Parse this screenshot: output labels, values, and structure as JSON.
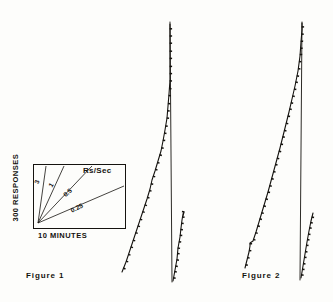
{
  "figure_sheet": {
    "background_color": "#fdfdfb",
    "ink_color": "#15130f"
  },
  "captions": {
    "figure_1": "Figure  1",
    "figure_2": "Figure  2"
  },
  "inset": {
    "name": "rate-calibration-inset",
    "header": "Rs/Sec",
    "y_axis_label": "300 RESPONSES",
    "x_axis_label": "10 MINUTES",
    "box": {
      "x": 33,
      "y": 164,
      "width": 92,
      "height": 64
    },
    "origin": {
      "x": 38,
      "y": 223
    },
    "rate_lines": [
      {
        "label": "3",
        "end_x": 46,
        "end_y": 166,
        "label_x": 36,
        "label_y": 180,
        "label_rotation": -73
      },
      {
        "label": "1",
        "end_x": 64,
        "end_y": 166,
        "label_x": 50,
        "label_y": 183,
        "label_rotation": -58
      },
      {
        "label": "0.5",
        "end_x": 92,
        "end_y": 166,
        "label_x": 64,
        "label_y": 192,
        "label_rotation": -42
      },
      {
        "label": "0.25",
        "end_x": 124,
        "end_y": 186,
        "label_x": 71,
        "label_y": 207,
        "label_rotation": -26
      }
    ]
  },
  "chart_data": {
    "type": "line",
    "xlabel": "10 MINUTES",
    "ylabel": "300 RESPONSES",
    "grid": false,
    "legend": "inset rate calibration (Rs/Sec: 3, 1, 0.5, 0.25)",
    "panels": [
      {
        "name": "Figure 1",
        "caption": "Figure  1",
        "segments": [
          {
            "name": "session-1-cumulative-record",
            "kind": "cumulative",
            "points": [
              [
                122,
                272
              ],
              [
                126,
                262
              ],
              [
                129,
                253
              ],
              [
                132,
                244
              ],
              [
                135,
                235
              ],
              [
                138,
                226
              ],
              [
                141,
                217
              ],
              [
                144,
                208
              ],
              [
                147,
                199
              ],
              [
                150,
                189
              ],
              [
                152,
                180
              ],
              [
                155,
                171
              ],
              [
                158,
                161
              ],
              [
                161,
                151
              ],
              [
                163,
                141
              ],
              [
                165,
                130
              ],
              [
                167,
                118
              ],
              [
                168,
                106
              ],
              [
                169,
                94
              ],
              [
                170,
                80
              ],
              [
                170,
                60
              ],
              [
                170,
                40
              ],
              [
                170,
                24
              ]
            ],
            "pip_count": 34
          },
          {
            "name": "session-1-reset-line",
            "kind": "reset",
            "points": [
              [
                170,
                22
              ],
              [
                172,
                282
              ]
            ]
          },
          {
            "name": "session-2-cumulative-record",
            "kind": "cumulative",
            "points": [
              [
                173,
                281
              ],
              [
                175,
                270
              ],
              [
                177,
                259
              ],
              [
                178,
                248
              ],
              [
                180,
                237
              ],
              [
                181,
                228
              ],
              [
                182,
                220
              ],
              [
                183,
                214
              ],
              [
                184,
                212
              ],
              [
                183,
                216
              ]
            ],
            "pip_count": 12
          }
        ]
      },
      {
        "name": "Figure 2",
        "caption": "Figure  2",
        "segments": [
          {
            "name": "session-1-cumulative-record",
            "kind": "cumulative",
            "points": [
              [
                245,
                268
              ],
              [
                247,
                260
              ],
              [
                249,
                252
              ],
              [
                250,
                246
              ],
              [
                250,
                243
              ],
              [
                253,
                241
              ],
              [
                256,
                232
              ],
              [
                259,
                222
              ],
              [
                262,
                212
              ],
              [
                265,
                202
              ],
              [
                268,
                192
              ],
              [
                271,
                181
              ],
              [
                274,
                170
              ],
              [
                277,
                159
              ],
              [
                280,
                148
              ],
              [
                283,
                136
              ],
              [
                286,
                124
              ],
              [
                289,
                112
              ],
              [
                292,
                99
              ],
              [
                295,
                86
              ],
              [
                298,
                71
              ],
              [
                300,
                56
              ],
              [
                301,
                42
              ],
              [
                302,
                30
              ],
              [
                302,
                23
              ]
            ],
            "pip_count": 36
          },
          {
            "name": "session-1-reset-line",
            "kind": "reset",
            "points": [
              [
                302,
                22
              ],
              [
                300,
                280
              ]
            ]
          },
          {
            "name": "session-2-cumulative-record",
            "kind": "cumulative",
            "points": [
              [
                301,
                278
              ],
              [
                303,
                266
              ],
              [
                305,
                254
              ],
              [
                307,
                242
              ],
              [
                309,
                231
              ],
              [
                311,
                221
              ],
              [
                313,
                213
              ]
            ],
            "pip_count": 11
          }
        ]
      }
    ]
  }
}
